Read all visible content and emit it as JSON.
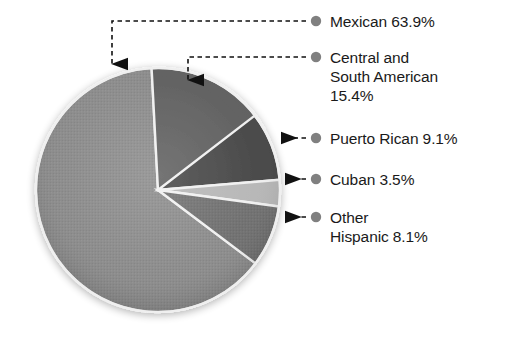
{
  "chart_data": {
    "type": "pie",
    "title": "",
    "subtitle": "",
    "xlabel": "",
    "ylabel": "",
    "legend_position": "right-callouts",
    "grid": false,
    "units": "percent",
    "categories": [
      "Mexican",
      "Central and South American",
      "Puerto Rican",
      "Cuban",
      "Other Hispanic"
    ],
    "values": [
      63.9,
      15.4,
      9.1,
      3.5,
      8.1
    ],
    "slices": [
      {
        "label": "Mexican",
        "value": 63.9,
        "value_text": "63.9%",
        "color": "#8a8a8a"
      },
      {
        "label": "Central and South American",
        "value": 15.4,
        "value_text": "15.4%",
        "color": "#5e5e5e"
      },
      {
        "label": "Puerto Rican",
        "value": 9.1,
        "value_text": "9.1%",
        "color": "#474747"
      },
      {
        "label": "Cuban",
        "value": 3.5,
        "value_text": "3.5%",
        "color": "#b4b4b4"
      },
      {
        "label": "Other Hispanic",
        "value": 8.1,
        "value_text": "8.1%",
        "color": "#7b7b7b"
      }
    ],
    "annotations": [
      {
        "text": "Mexican 63.9%"
      },
      {
        "text": "Central and South American 15.4%"
      },
      {
        "text": "Puerto Rican 9.1%"
      },
      {
        "text": "Cuban 3.5%"
      },
      {
        "text": "Other Hispanic 8.1%"
      }
    ]
  },
  "callouts": {
    "mexican": {
      "line1": "Mexican 63.9%",
      "line2": "",
      "line3": ""
    },
    "central_south_american": {
      "line1": "Central and",
      "line2": "South American",
      "line3": "15.4%"
    },
    "puerto_rican": {
      "line1": "Puerto Rican 9.1%",
      "line2": "",
      "line3": ""
    },
    "cuban": {
      "line1": "Cuban 3.5%",
      "line2": "",
      "line3": ""
    },
    "other_hispanic": {
      "line1": "Other",
      "line2": "Hispanic 8.1%",
      "line3": ""
    }
  },
  "colors": {
    "bullet": "#808080",
    "leader": "#1a1a1a",
    "text": "#1a1a1a",
    "slice_outline": "#f2f2f2",
    "background": "#ffffff"
  }
}
